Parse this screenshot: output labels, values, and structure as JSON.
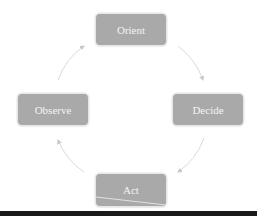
{
  "diagram": {
    "type": "cycle",
    "title": "",
    "nodes": [
      {
        "id": "orient",
        "label": "Orient"
      },
      {
        "id": "decide",
        "label": "Decide"
      },
      {
        "id": "act",
        "label": "Act"
      },
      {
        "id": "observe",
        "label": "Observe"
      }
    ],
    "edges": [
      {
        "from": "orient",
        "to": "decide"
      },
      {
        "from": "decide",
        "to": "act"
      },
      {
        "from": "act",
        "to": "observe"
      },
      {
        "from": "observe",
        "to": "orient"
      }
    ],
    "colors": {
      "node_fill": "#a9a9a9",
      "node_text": "#f4f4f4",
      "arrow": "#d0d0d0",
      "bottom_bar": "#1a1a1a"
    }
  }
}
